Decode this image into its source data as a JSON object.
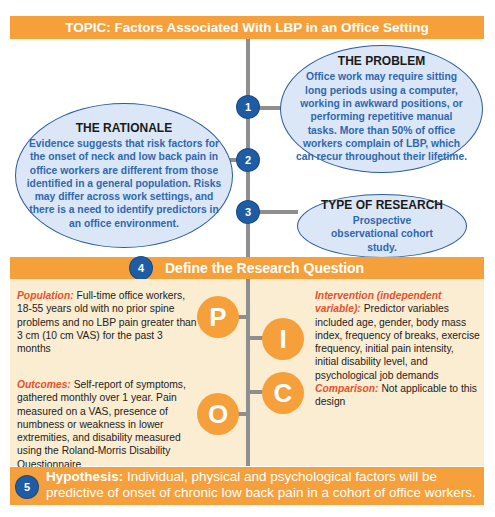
{
  "topic": {
    "label": "TOPIC: Factors Associated With LBP in an Office Setting"
  },
  "steps": [
    {
      "number": "1",
      "title": "THE PROBLEM",
      "body": "Office work may require sitting long periods using a computer, working in awkward positions, or performing repetitive manual tasks. More than 50% of office workers complain of LBP, which can recur throughout their lifetime."
    },
    {
      "number": "2",
      "title": "THE RATIONALE",
      "body": "Evidence suggests that risk factors for the onset of neck and low back pain in office workers are different from those identified in a general population. Risks may differ across work settings, and there is a need to identify predictors in an office environment."
    },
    {
      "number": "3",
      "title": "TYPE OF RESEARCH",
      "body": "Prospective observational cohort study."
    }
  ],
  "research_question": {
    "number": "4",
    "title": "Define the Research Question"
  },
  "pico": {
    "population": {
      "letter": "P",
      "label": "Population:",
      "text": " Full-time office workers, 18-55 years old with no prior spine problems and no LBP pain greater than 3 cm (10 cm VAS) for the past 3 months"
    },
    "intervention": {
      "letter": "I",
      "label": "Intervention (independent variable):",
      "text": " Predictor variables included age, gender, body mass index, frequency of breaks, exercise frequency, initial pain intensity, initial disability level, and psychological job demands"
    },
    "comparison": {
      "letter": "C",
      "label": "Comparison:",
      "text": " Not applicable to this design"
    },
    "outcomes": {
      "letter": "O",
      "label": "Outcomes:",
      "text": " Self-report of symptoms, gathered monthly over 1 year. Pain measured on a VAS, presence of numbness or weakness in lower extremities, and disability measured using the Roland-Morris Disability Questionnaire"
    }
  },
  "hypothesis": {
    "number": "5",
    "label": "Hypothesis:",
    "text": " Individual, physical and psychological factors will be predictive of onset of chronic low back pain in a cohort of office workers."
  },
  "colors": {
    "orange": "#f5a03a",
    "blue_circle": "#1f5ca4",
    "ellipse_fill": "#dbe7f6",
    "ellipse_text": "#2f67b0",
    "panel_bg": "#fbedd2",
    "label_red": "#e8512a",
    "connector_gray": "#8e8e90"
  }
}
